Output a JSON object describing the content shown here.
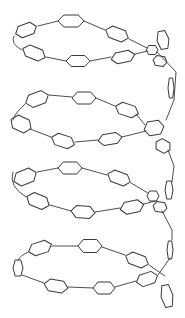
{
  "diagram": {
    "type": "helix-line-art",
    "stroke_color": "#3a3a3a",
    "background": "#ffffff",
    "turns": 4,
    "rings": [
      {
        "cx": 26,
        "cy": 30,
        "w": 22,
        "h": 12,
        "rot": -20
      },
      {
        "cx": 71,
        "cy": 21,
        "w": 26,
        "h": 12,
        "rot": 0
      },
      {
        "cx": 117,
        "cy": 34,
        "w": 24,
        "h": 12,
        "rot": 20
      },
      {
        "cx": 34,
        "cy": 53,
        "w": 24,
        "h": 12,
        "rot": 22
      },
      {
        "cx": 78,
        "cy": 61,
        "w": 24,
        "h": 11,
        "rot": 0
      },
      {
        "cx": 123,
        "cy": 57,
        "w": 24,
        "h": 11,
        "rot": -12
      },
      {
        "cx": 152,
        "cy": 50,
        "w": 12,
        "h": 9,
        "rot": 0
      },
      {
        "cx": 163,
        "cy": 40,
        "w": 12,
        "h": 18,
        "rot": -10
      },
      {
        "cx": 160,
        "cy": 61,
        "w": 14,
        "h": 10,
        "rot": 10
      },
      {
        "cx": 171,
        "cy": 88,
        "w": 6,
        "h": 20,
        "rot": 0
      },
      {
        "cx": 37,
        "cy": 99,
        "w": 24,
        "h": 13,
        "rot": -20
      },
      {
        "cx": 84,
        "cy": 98,
        "w": 24,
        "h": 12,
        "rot": 0
      },
      {
        "cx": 127,
        "cy": 110,
        "w": 24,
        "h": 12,
        "rot": 18
      },
      {
        "cx": 21,
        "cy": 124,
        "w": 22,
        "h": 14,
        "rot": 25
      },
      {
        "cx": 63,
        "cy": 141,
        "w": 24,
        "h": 12,
        "rot": 18
      },
      {
        "cx": 110,
        "cy": 139,
        "w": 24,
        "h": 11,
        "rot": -10
      },
      {
        "cx": 154,
        "cy": 128,
        "w": 20,
        "h": 14,
        "rot": -10
      },
      {
        "cx": 163,
        "cy": 146,
        "w": 16,
        "h": 12,
        "rot": 30
      },
      {
        "cx": 25,
        "cy": 177,
        "w": 24,
        "h": 14,
        "rot": -22
      },
      {
        "cx": 70,
        "cy": 168,
        "w": 24,
        "h": 12,
        "rot": 0
      },
      {
        "cx": 119,
        "cy": 178,
        "w": 24,
        "h": 12,
        "rot": 20
      },
      {
        "cx": 38,
        "cy": 201,
        "w": 24,
        "h": 13,
        "rot": 22
      },
      {
        "cx": 83,
        "cy": 212,
        "w": 24,
        "h": 12,
        "rot": 5
      },
      {
        "cx": 132,
        "cy": 207,
        "w": 24,
        "h": 12,
        "rot": -12
      },
      {
        "cx": 153,
        "cy": 196,
        "w": 12,
        "h": 10,
        "rot": 0
      },
      {
        "cx": 160,
        "cy": 207,
        "w": 14,
        "h": 10,
        "rot": 10
      },
      {
        "cx": 169,
        "cy": 190,
        "w": 8,
        "h": 18,
        "rot": 0
      },
      {
        "cx": 40,
        "cy": 248,
        "w": 24,
        "h": 12,
        "rot": -18
      },
      {
        "cx": 90,
        "cy": 246,
        "w": 24,
        "h": 13,
        "rot": 0
      },
      {
        "cx": 137,
        "cy": 260,
        "w": 24,
        "h": 12,
        "rot": 20
      },
      {
        "cx": 18,
        "cy": 268,
        "w": 10,
        "h": 16,
        "rot": 0
      },
      {
        "cx": 56,
        "cy": 286,
        "w": 24,
        "h": 12,
        "rot": 10
      },
      {
        "cx": 104,
        "cy": 288,
        "w": 22,
        "h": 12,
        "rot": 0
      },
      {
        "cx": 147,
        "cy": 279,
        "w": 22,
        "h": 12,
        "rot": -18
      },
      {
        "cx": 167,
        "cy": 296,
        "w": 12,
        "h": 22,
        "rot": -10
      },
      {
        "cx": 170,
        "cy": 250,
        "w": 6,
        "h": 18,
        "rot": 0
      }
    ],
    "links": [
      "M14,36 Q10,44 22,50",
      "M38,26 L58,21",
      "M84,21 L105,30",
      "M129,39 L147,48",
      "M46,57 L66,61",
      "M90,61 L111,57",
      "M135,54 L148,51",
      "M157,52 L176,72 L174,100 L166,120",
      "M145,125 L136,114",
      "M49,95 L72,97",
      "M96,98 L115,106",
      "M25,104 Q14,114 13,120",
      "M30,129 L51,137",
      "M75,142 L98,140",
      "M122,137 L146,131",
      "M168,150 L174,166 L172,182",
      "M13,172 Q8,186 26,197",
      "M37,172 L58,168",
      "M82,168 L107,175",
      "M131,183 L148,193",
      "M50,205 L71,211",
      "M95,212 L120,208",
      "M144,204 L155,201",
      "M162,211 L172,230 L172,240",
      "M28,252 Q20,256 18,260",
      "M52,246 L78,246",
      "M102,247 L125,255",
      "M149,265 L165,276",
      "M22,275 L44,283",
      "M68,287 L93,288",
      "M115,287 L136,281",
      "M158,275 L170,258"
    ]
  }
}
